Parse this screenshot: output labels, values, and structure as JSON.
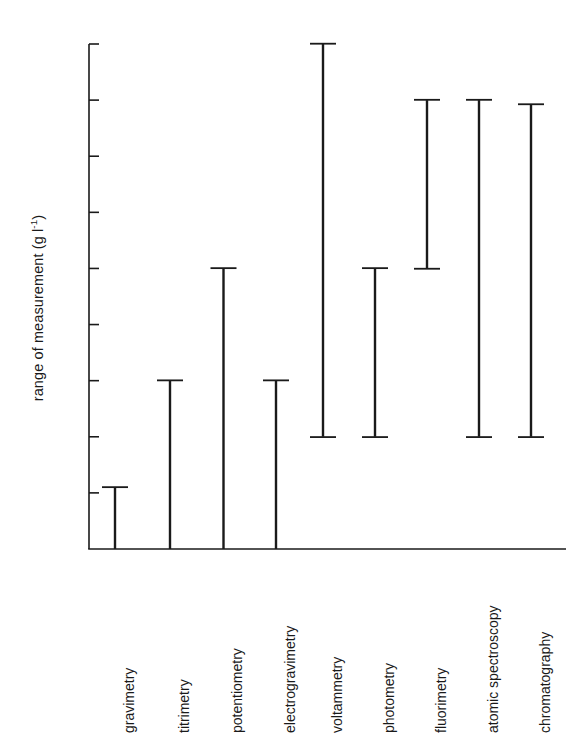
{
  "chart_data": {
    "type": "bar",
    "title": "",
    "subtitle": "",
    "xlabel": "",
    "ylabel": "range of measurement (g l",
    "ylabel_sup": "-1",
    "ylabel_tail": ")",
    "orientation": "vertical",
    "scale": "log",
    "grid": false,
    "legend": null,
    "note": "Floating range bars (I-bars) showing the concentration range over which each analytical technique can measure. Axis is logarithmic and inverted: 10^-10 at top, 10^-1 at bottom.",
    "ylim": [
      1e-10,
      0.1
    ],
    "y_axis_inverted": true,
    "ytick_values": [
      1e-10,
      1e-09,
      1e-08,
      1e-07,
      1e-06,
      1e-05,
      0.0001,
      0.001,
      0.01,
      0.1
    ],
    "ytick_labels": [
      {
        "base": "10",
        "exp": "-10"
      },
      {
        "base": "10",
        "exp": "-9"
      },
      {
        "base": "10",
        "exp": "-8"
      },
      {
        "base": "10",
        "exp": "-7"
      },
      {
        "base": "10",
        "exp": "-6"
      },
      {
        "base": "10",
        "exp": "-5"
      },
      {
        "base": "10",
        "exp": "-4"
      },
      {
        "base": "10",
        "exp": "-3"
      },
      {
        "base": "10",
        "exp": "-2"
      },
      {
        "base": "10",
        "exp": "-1"
      }
    ],
    "categories": [
      "gravimetry",
      "titrimetry",
      "potentiometry",
      "electrogravimetry",
      "voltammetry",
      "photometry",
      "fluorimetry",
      "atomic spectroscopy",
      "chromatography"
    ],
    "series": [
      {
        "name": "range of measurement",
        "ranges": [
          {
            "category": "gravimetry",
            "low": 0.008,
            "high": 0.1
          },
          {
            "category": "titrimetry",
            "low": 0.0001,
            "high": 0.1
          },
          {
            "category": "potentiometry",
            "low": 1e-06,
            "high": 0.1
          },
          {
            "category": "electrogravimetry",
            "low": 0.0001,
            "high": 0.1
          },
          {
            "category": "voltammetry",
            "low": 1e-10,
            "high": 0.001
          },
          {
            "category": "photometry",
            "low": 1e-06,
            "high": 0.001
          },
          {
            "category": "fluorimetry",
            "low": 1e-09,
            "high": 1e-06
          },
          {
            "category": "atomic spectroscopy",
            "low": 1e-09,
            "high": 0.001
          },
          {
            "category": "chromatography",
            "low": 1.2e-09,
            "high": 0.001
          }
        ]
      }
    ],
    "colors": {
      "bar": "#1a1a1a",
      "axis": "#1a1a1a",
      "background": "#ffffff",
      "text": "#1a1a1a"
    }
  }
}
